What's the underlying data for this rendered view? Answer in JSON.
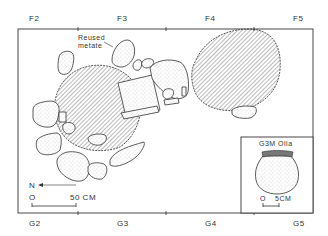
{
  "grid": {
    "top_labels": [
      "F2",
      "F3",
      "F4",
      "F5"
    ],
    "bottom_labels": [
      "G2",
      "G3",
      "G4",
      "G5"
    ]
  },
  "annotations": {
    "reused_metate_line1": "Reused",
    "reused_metate_line2": "metate"
  },
  "north_arrow": {
    "label": "N"
  },
  "scale_bar": {
    "start": "O",
    "end": "50 CM"
  },
  "inset": {
    "title": "G3M Olla",
    "scale_start": "O",
    "scale_end": "5CM"
  },
  "colors": {
    "line": "#333333",
    "hatch": "#555555",
    "stipple": "#bbbbbb",
    "background": "#ffffff"
  }
}
